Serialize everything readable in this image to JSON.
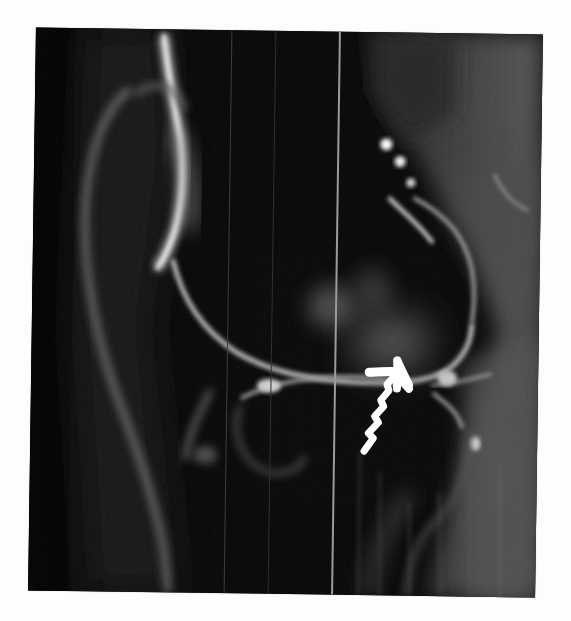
{
  "figure": {
    "type": "sagittal knee MRI scan",
    "background_color": "#fdfdfd",
    "scan_background_color": "#0a0a0a",
    "annotation": {
      "kind": "arrow",
      "icon": "arrow-icon",
      "color": "#ffffff",
      "direction": "up-right",
      "target": "posterior horn meniscus / articular cartilage region"
    },
    "artifacts": {
      "vertical_scan_lines": 3
    }
  }
}
